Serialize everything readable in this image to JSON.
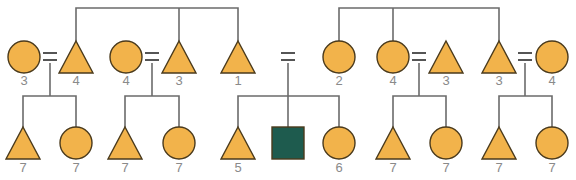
{
  "diagram": {
    "type": "pedigree",
    "colors": {
      "fill": "#F2B34B",
      "affected": "#1E5B4E",
      "line": "#6b6b6b",
      "label": "#8a8a8a"
    },
    "top_row": [
      {
        "id": "t1",
        "shape": "circle",
        "x": 24,
        "label": "3"
      },
      {
        "id": "t2",
        "shape": "triangle",
        "x": 76,
        "label": "4"
      },
      {
        "id": "t3",
        "shape": "circle",
        "x": 126,
        "label": "4"
      },
      {
        "id": "t4",
        "shape": "triangle",
        "x": 179,
        "label": "3"
      },
      {
        "id": "t5",
        "shape": "triangle",
        "x": 238,
        "label": "1"
      },
      {
        "id": "t6",
        "shape": "circle",
        "x": 339,
        "label": "2"
      },
      {
        "id": "t7",
        "shape": "circle",
        "x": 393,
        "label": "4"
      },
      {
        "id": "t8",
        "shape": "triangle",
        "x": 446,
        "label": "3"
      },
      {
        "id": "t9",
        "shape": "triangle",
        "x": 499,
        "label": "3"
      },
      {
        "id": "t10",
        "shape": "circle",
        "x": 552,
        "label": "4"
      }
    ],
    "marriages": [
      {
        "x": 50
      },
      {
        "x": 152
      },
      {
        "x": 288
      },
      {
        "x": 419
      },
      {
        "x": 525
      }
    ],
    "bottom_row": [
      {
        "id": "b1",
        "shape": "triangle",
        "x": 23,
        "label": "7"
      },
      {
        "id": "b2",
        "shape": "circle",
        "x": 76,
        "label": "7"
      },
      {
        "id": "b3",
        "shape": "triangle",
        "x": 125,
        "label": "7"
      },
      {
        "id": "b4",
        "shape": "circle",
        "x": 179,
        "label": "7"
      },
      {
        "id": "b5",
        "shape": "triangle",
        "x": 238,
        "label": "5"
      },
      {
        "id": "b6",
        "shape": "square",
        "x": 288,
        "label": "",
        "affected": true
      },
      {
        "id": "b7",
        "shape": "circle",
        "x": 339,
        "label": "6"
      },
      {
        "id": "b8",
        "shape": "triangle",
        "x": 393,
        "label": "7"
      },
      {
        "id": "b9",
        "shape": "circle",
        "x": 446,
        "label": "7"
      },
      {
        "id": "b10",
        "shape": "triangle",
        "x": 499,
        "label": "7"
      },
      {
        "id": "b11",
        "shape": "circle",
        "x": 552,
        "label": "7"
      }
    ]
  }
}
